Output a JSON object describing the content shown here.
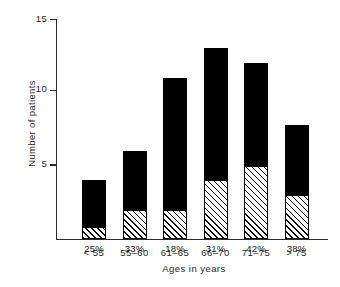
{
  "chart_data": {
    "type": "bar",
    "title": "",
    "subtitle": "",
    "xlabel": "Ages in years",
    "ylabel": "Number of patients",
    "categories": [
      "< 55",
      "55–60",
      "61–65",
      "66–70",
      "71–75",
      "> 75"
    ],
    "ylim": [
      0,
      15
    ],
    "yticks": [
      5,
      10,
      15
    ],
    "ytick_labels": [
      "5",
      "10",
      "15"
    ],
    "grid": false,
    "legend": "none",
    "stacked": true,
    "series": [
      {
        "name": "hatched-lower-segment",
        "values": [
          0.8,
          2,
          2,
          4,
          5,
          3
        ]
      },
      {
        "name": "solid-upper-segment",
        "values": [
          3.2,
          4,
          9,
          9,
          7,
          4.8
        ]
      }
    ],
    "totals": [
      4,
      6,
      11,
      13,
      12,
      7.8
    ],
    "data_labels": [
      "25%",
      "33%",
      "18%",
      "31%",
      "42%",
      "38%"
    ]
  },
  "axis": {
    "y_title": "Number of patients",
    "x_title": "Ages in years",
    "y_tick_15": "15",
    "y_tick_10": "10",
    "y_tick_5": "5"
  },
  "bars": [
    {
      "category": "< 55",
      "total": 4,
      "hatched": 0.8,
      "percent": "25%"
    },
    {
      "category": "55–60",
      "total": 6,
      "hatched": 2,
      "percent": "33%"
    },
    {
      "category": "61–65",
      "total": 11,
      "hatched": 2,
      "percent": "18%"
    },
    {
      "category": "66–70",
      "total": 13,
      "hatched": 4,
      "percent": "31%"
    },
    {
      "category": "71–75",
      "total": 12,
      "hatched": 5,
      "percent": "42%"
    },
    {
      "category": "> 75",
      "total": 7.8,
      "hatched": 3,
      "percent": "38%"
    }
  ],
  "colors": {
    "solid": "#000000",
    "hatch_line": "#000000",
    "hatch_background": "#ffffff",
    "axis": "#2b2b2b",
    "text": "#1f1f1f",
    "page_background": "#ffffff"
  }
}
